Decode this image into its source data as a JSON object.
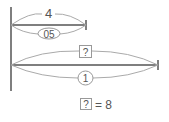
{
  "diagram": {
    "top_bar": {
      "length_label": "4",
      "ratio_label": "0.5"
    },
    "bottom_bar": {
      "length_label": "?",
      "ratio_label": "1"
    },
    "answer": {
      "unknown": "?",
      "equals_text": "= 8"
    }
  }
}
